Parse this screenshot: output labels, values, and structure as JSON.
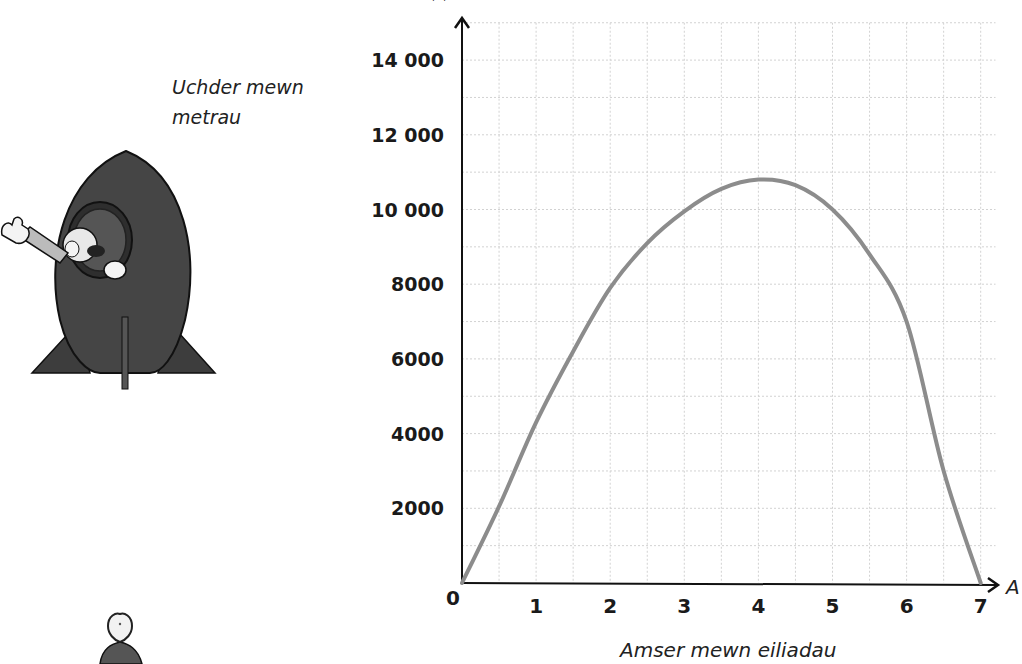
{
  "chart_data": {
    "type": "line",
    "title": "",
    "xlabel": "Amser mewn eiliadau",
    "ylabel": "Uchder mewn metrau",
    "x_axis_letter": "A",
    "x_ticks": [
      "0",
      "1",
      "2",
      "3",
      "4",
      "5",
      "6",
      "7"
    ],
    "y_ticks": [
      "2000",
      "4000",
      "6000",
      "8000",
      "10 000",
      "12 000",
      "14 000"
    ],
    "xlim": [
      0,
      7.2
    ],
    "ylim": [
      0,
      15000
    ],
    "grid": true,
    "grid_x_step": 0.5,
    "grid_y_step": 1000,
    "series": [
      {
        "name": "Uchder",
        "color": "#8c8c8c",
        "x": [
          0,
          0.5,
          1,
          1.5,
          2,
          2.5,
          3,
          3.5,
          4,
          4.5,
          5,
          5.5,
          6,
          6.5,
          7
        ],
        "y": [
          0,
          2050,
          4300,
          6200,
          7900,
          9100,
          9950,
          10550,
          10800,
          10650,
          10000,
          8800,
          7000,
          3000,
          0
        ]
      }
    ]
  },
  "labels": {
    "y_axis_title": "Uchder mewn metrau",
    "x_axis_title": "Amser mewn eiliadau",
    "x_axis_letter": "A"
  },
  "illustrations": {
    "rocket": "rocket-with-waving-astronaut",
    "person": "person-figure"
  }
}
